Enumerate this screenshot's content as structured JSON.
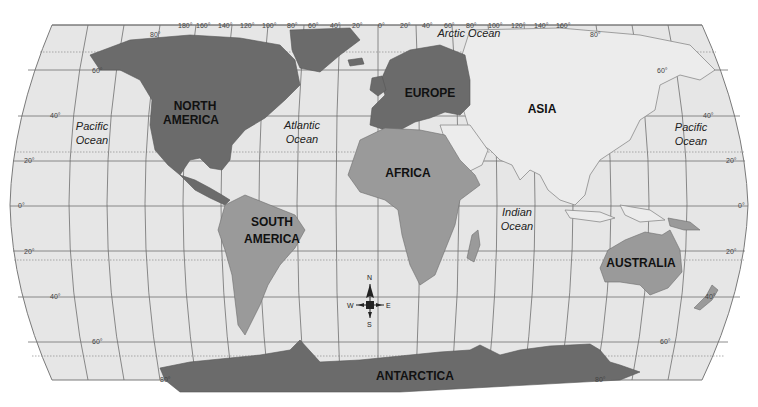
{
  "map": {
    "title": "World Map",
    "colors": {
      "ocean": "#e6e6e6",
      "land_dark": "#6b6b6b",
      "land_mid": "#9a9a9a",
      "land_light": "#ececec",
      "grid": "#6e6e6e"
    },
    "continents": [
      {
        "name": "NORTH AMERICA",
        "line1": "NORTH",
        "line2": "AMERICA"
      },
      {
        "name": "SOUTH AMERICA",
        "line1": "SOUTH",
        "line2": "AMERICA"
      },
      {
        "name": "EUROPE",
        "line1": "EUROPE"
      },
      {
        "name": "ASIA",
        "line1": "ASIA"
      },
      {
        "name": "AFRICA",
        "line1": "AFRICA"
      },
      {
        "name": "AUSTRALIA",
        "line1": "AUSTRALIA"
      },
      {
        "name": "ANTARCTICA",
        "line1": "ANTARCTICA"
      }
    ],
    "oceans": [
      {
        "name": "Pacific Ocean (west)",
        "line1": "Pacific",
        "line2": "Ocean"
      },
      {
        "name": "Atlantic Ocean",
        "line1": "Atlantic",
        "line2": "Ocean"
      },
      {
        "name": "Indian Ocean",
        "line1": "Indian",
        "line2": "Ocean"
      },
      {
        "name": "Pacific Ocean (east)",
        "line1": "Pacific",
        "line2": "Ocean"
      },
      {
        "name": "Arctic Ocean",
        "line1": "Arctic Ocean"
      }
    ],
    "longitude_labels": [
      "180°",
      "160°",
      "140°",
      "120°",
      "100°",
      "80°",
      "60°",
      "40°",
      "20°",
      "0°",
      "20°",
      "40°",
      "60°",
      "80°",
      "100°",
      "120°",
      "140°",
      "160°"
    ],
    "latitude_labels_left": [
      "80°",
      "60°",
      "40°",
      "20°",
      "0°",
      "20°",
      "40°",
      "60°",
      "80°"
    ],
    "latitude_labels_right": [
      "80°",
      "60°",
      "40°",
      "20°",
      "0°",
      "20°",
      "40°",
      "60°",
      "80°"
    ],
    "compass": {
      "n": "N",
      "s": "S",
      "e": "E",
      "w": "W"
    }
  }
}
